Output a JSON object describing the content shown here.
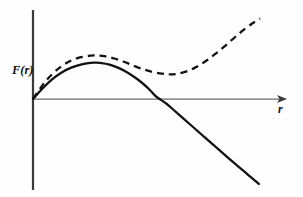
{
  "figure": {
    "background_color": "#fefefe",
    "ink_color": "#121212",
    "axis_color": "#4a4a4a",
    "width": 303,
    "height": 197
  },
  "axes": {
    "y_axis": {
      "label": "F(r)",
      "name": "force-axis",
      "origin_x": 33,
      "top_y": 10,
      "bottom_y": 190,
      "has_arrow": false
    },
    "x_axis": {
      "label": "r",
      "name": "radius-axis",
      "y": 99,
      "start_x": 33,
      "end_x": 287,
      "has_arrow": true,
      "arrow_direction": "right"
    },
    "label_positions": {
      "y_label_x": 12,
      "y_label_y": 74,
      "x_label_x": 278,
      "x_label_y": 113
    }
  },
  "chart_data": {
    "type": "line",
    "title": "",
    "xlabel": "r",
    "ylabel": "F(r)",
    "xlim": [
      0,
      10
    ],
    "ylim": [
      -4.2,
      3.2
    ],
    "grid": false,
    "legend": "none",
    "axis_origin": [
      0,
      0
    ],
    "series": [
      {
        "name": "solid-force-curve",
        "style": "solid",
        "color": "#121212",
        "points": [
          [
            0.0,
            0.0
          ],
          [
            0.4,
            0.42
          ],
          [
            0.8,
            0.78
          ],
          [
            1.2,
            1.05
          ],
          [
            1.6,
            1.24
          ],
          [
            2.0,
            1.36
          ],
          [
            2.4,
            1.43
          ],
          [
            2.6,
            1.44
          ],
          [
            2.8,
            1.43
          ],
          [
            3.2,
            1.36
          ],
          [
            3.6,
            1.22
          ],
          [
            4.0,
            1.02
          ],
          [
            4.4,
            0.76
          ],
          [
            4.8,
            0.44
          ],
          [
            5.12,
            0.12
          ],
          [
            5.3,
            0.0
          ],
          [
            5.6,
            -0.23
          ],
          [
            6.0,
            -0.62
          ],
          [
            6.6,
            -1.2
          ],
          [
            7.2,
            -1.78
          ],
          [
            7.8,
            -2.36
          ],
          [
            8.4,
            -2.94
          ],
          [
            9.0,
            -3.5
          ],
          [
            9.45,
            -3.92
          ]
        ]
      },
      {
        "name": "dashed-harmonic-curve",
        "style": "dashed",
        "color": "#121212",
        "dash_pattern": [
          7,
          5
        ],
        "points": [
          [
            0.0,
            0.0
          ],
          [
            0.4,
            0.55
          ],
          [
            0.8,
            0.98
          ],
          [
            1.2,
            1.3
          ],
          [
            1.6,
            1.52
          ],
          [
            2.0,
            1.65
          ],
          [
            2.4,
            1.71
          ],
          [
            2.7,
            1.72
          ],
          [
            3.0,
            1.69
          ],
          [
            3.4,
            1.6
          ],
          [
            3.8,
            1.47
          ],
          [
            4.2,
            1.32
          ],
          [
            4.6,
            1.18
          ],
          [
            5.0,
            1.07
          ],
          [
            5.4,
            1.0
          ],
          [
            5.7,
            0.97
          ],
          [
            6.0,
            0.99
          ],
          [
            6.4,
            1.08
          ],
          [
            6.8,
            1.25
          ],
          [
            7.2,
            1.48
          ],
          [
            7.6,
            1.76
          ],
          [
            8.0,
            2.07
          ],
          [
            8.4,
            2.4
          ],
          [
            8.8,
            2.72
          ],
          [
            9.2,
            3.0
          ],
          [
            9.5,
            3.18
          ]
        ]
      }
    ],
    "annotations": [
      {
        "name": "y-axis-label",
        "text": "F(r)",
        "style": "italic-bold-serif"
      },
      {
        "name": "x-axis-label",
        "text": "r",
        "style": "italic-bold-serif"
      }
    ]
  }
}
